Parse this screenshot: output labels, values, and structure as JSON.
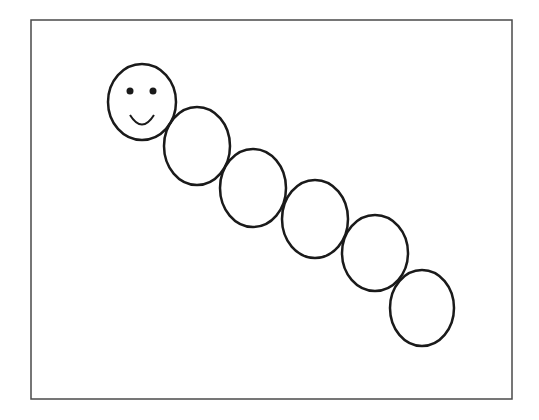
{
  "figure": {
    "stroke_color": "#1a1a1a",
    "frame_color": "#4a4a4a",
    "background": "#ffffff",
    "frame": {
      "x": 31,
      "y": 20,
      "width": 481,
      "height": 379
    },
    "head": {
      "cx": 142,
      "cy": 102,
      "rx": 34,
      "ry": 38,
      "eyes": [
        {
          "cx": 130,
          "cy": 91,
          "r": 3.5
        },
        {
          "cx": 153,
          "cy": 91,
          "r": 3.5
        }
      ],
      "smile": {
        "x1": 130,
        "y1": 115,
        "x2": 154,
        "y2": 115,
        "depth": 12
      }
    },
    "segments": [
      {
        "cx": 197,
        "cy": 146,
        "rx": 33,
        "ry": 39
      },
      {
        "cx": 253,
        "cy": 188,
        "rx": 33,
        "ry": 39
      },
      {
        "cx": 315,
        "cy": 219,
        "rx": 33,
        "ry": 39
      },
      {
        "cx": 375,
        "cy": 253,
        "rx": 33,
        "ry": 38
      },
      {
        "cx": 422,
        "cy": 308,
        "rx": 32,
        "ry": 38
      }
    ]
  }
}
